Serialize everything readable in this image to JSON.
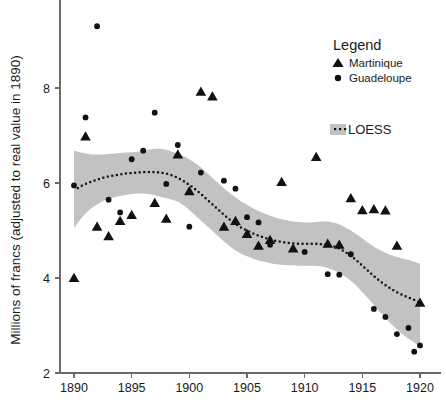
{
  "chart_data": {
    "type": "scatter",
    "title": "",
    "xlabel": "",
    "ylabel": "Millions of francs (adjusted to real value in 1890)",
    "xlim": [
      1889.0,
      1920.8
    ],
    "ylim": [
      2.0,
      9.6
    ],
    "xticks": [
      1890,
      1895,
      1900,
      1905,
      1910,
      1915,
      1920
    ],
    "yticks": [
      2,
      4,
      6,
      8
    ],
    "grid": false,
    "legend_position": "top-right",
    "legend_title": "Legend",
    "series": [
      {
        "name": "Martinique",
        "marker": "triangle",
        "color": "#111111",
        "points": [
          [
            1890,
            4.0
          ],
          [
            1891,
            6.98
          ],
          [
            1892,
            5.08
          ],
          [
            1893,
            4.88
          ],
          [
            1894,
            5.2
          ],
          [
            1895,
            5.33
          ],
          [
            1897,
            5.58
          ],
          [
            1898,
            5.25
          ],
          [
            1899,
            6.6
          ],
          [
            1900,
            5.83
          ],
          [
            1901,
            7.92
          ],
          [
            1902,
            7.82
          ],
          [
            1903,
            5.08
          ],
          [
            1904,
            5.2
          ],
          [
            1905,
            4.93
          ],
          [
            1906,
            4.68
          ],
          [
            1907,
            4.8
          ],
          [
            1908,
            6.02
          ],
          [
            1909,
            4.62
          ],
          [
            1911,
            6.55
          ],
          [
            1912,
            4.72
          ],
          [
            1913,
            4.7
          ],
          [
            1914,
            5.68
          ],
          [
            1915,
            5.43
          ],
          [
            1916,
            5.45
          ],
          [
            1917,
            5.42
          ],
          [
            1918,
            4.68
          ],
          [
            1920,
            3.48
          ]
        ]
      },
      {
        "name": "Guadeloupe",
        "marker": "circle",
        "color": "#111111",
        "points": [
          [
            1890,
            5.95
          ],
          [
            1891,
            7.38
          ],
          [
            1892,
            9.3
          ],
          [
            1893,
            5.65
          ],
          [
            1894,
            5.38
          ],
          [
            1895,
            6.5
          ],
          [
            1896,
            6.68
          ],
          [
            1897,
            7.48
          ],
          [
            1898,
            5.98
          ],
          [
            1899,
            6.8
          ],
          [
            1900,
            5.08
          ],
          [
            1901,
            6.22
          ],
          [
            1903,
            6.05
          ],
          [
            1904,
            5.88
          ],
          [
            1905,
            5.28
          ],
          [
            1906,
            5.17
          ],
          [
            1907,
            4.7
          ],
          [
            1910,
            4.55
          ],
          [
            1912,
            4.08
          ],
          [
            1913,
            4.07
          ],
          [
            1914,
            4.5
          ],
          [
            1916,
            3.35
          ],
          [
            1917,
            3.18
          ],
          [
            1918,
            2.82
          ],
          [
            1919,
            2.95
          ],
          [
            1919.5,
            2.45
          ],
          [
            1920,
            2.58
          ]
        ]
      }
    ],
    "loess": {
      "name": "LOESS",
      "line_style": "dotted",
      "band_color": "#c2c2c2",
      "fit": [
        [
          1890.0,
          5.84
        ],
        [
          1890.5,
          5.92
        ],
        [
          1891.0,
          5.98
        ],
        [
          1891.5,
          6.03
        ],
        [
          1892.0,
          6.07
        ],
        [
          1892.5,
          6.11
        ],
        [
          1893.0,
          6.14
        ],
        [
          1893.5,
          6.16
        ],
        [
          1894.0,
          6.18
        ],
        [
          1894.5,
          6.2
        ],
        [
          1895.0,
          6.21
        ],
        [
          1895.5,
          6.22
        ],
        [
          1896.0,
          6.23
        ],
        [
          1896.5,
          6.23
        ],
        [
          1897.0,
          6.23
        ],
        [
          1897.5,
          6.22
        ],
        [
          1898.0,
          6.2
        ],
        [
          1898.5,
          6.16
        ],
        [
          1899.0,
          6.11
        ],
        [
          1899.5,
          6.04
        ],
        [
          1900.0,
          5.96
        ],
        [
          1900.5,
          5.87
        ],
        [
          1901.0,
          5.77
        ],
        [
          1901.5,
          5.66
        ],
        [
          1902.0,
          5.55
        ],
        [
          1902.5,
          5.44
        ],
        [
          1903.0,
          5.33
        ],
        [
          1903.5,
          5.23
        ],
        [
          1904.0,
          5.14
        ],
        [
          1904.5,
          5.06
        ],
        [
          1905.0,
          5.0
        ],
        [
          1905.5,
          4.94
        ],
        [
          1906.0,
          4.89
        ],
        [
          1906.5,
          4.85
        ],
        [
          1907.0,
          4.81
        ],
        [
          1907.5,
          4.78
        ],
        [
          1908.0,
          4.76
        ],
        [
          1908.5,
          4.74
        ],
        [
          1909.0,
          4.73
        ],
        [
          1909.5,
          4.72
        ],
        [
          1910.0,
          4.72
        ],
        [
          1910.5,
          4.72
        ],
        [
          1911.0,
          4.72
        ],
        [
          1911.5,
          4.71
        ],
        [
          1912.0,
          4.7
        ],
        [
          1912.5,
          4.67
        ],
        [
          1913.0,
          4.62
        ],
        [
          1913.5,
          4.55
        ],
        [
          1914.0,
          4.47
        ],
        [
          1914.5,
          4.37
        ],
        [
          1915.0,
          4.26
        ],
        [
          1915.5,
          4.15
        ],
        [
          1916.0,
          4.04
        ],
        [
          1916.5,
          3.94
        ],
        [
          1917.0,
          3.85
        ],
        [
          1917.5,
          3.77
        ],
        [
          1918.0,
          3.7
        ],
        [
          1918.5,
          3.64
        ],
        [
          1919.0,
          3.59
        ],
        [
          1919.5,
          3.54
        ],
        [
          1920.0,
          3.48
        ]
      ],
      "upper": [
        [
          1890.0,
          6.68
        ],
        [
          1890.5,
          6.65
        ],
        [
          1891.0,
          6.62
        ],
        [
          1891.5,
          6.6
        ],
        [
          1892.0,
          6.6
        ],
        [
          1892.5,
          6.6
        ],
        [
          1893.0,
          6.61
        ],
        [
          1893.5,
          6.62
        ],
        [
          1894.0,
          6.63
        ],
        [
          1894.5,
          6.64
        ],
        [
          1895.0,
          6.65
        ],
        [
          1895.5,
          6.66
        ],
        [
          1896.0,
          6.68
        ],
        [
          1896.5,
          6.7
        ],
        [
          1897.0,
          6.72
        ],
        [
          1897.5,
          6.72
        ],
        [
          1898.0,
          6.7
        ],
        [
          1898.5,
          6.66
        ],
        [
          1899.0,
          6.62
        ],
        [
          1899.5,
          6.57
        ],
        [
          1900.0,
          6.5
        ],
        [
          1900.5,
          6.42
        ],
        [
          1901.0,
          6.33
        ],
        [
          1901.5,
          6.22
        ],
        [
          1902.0,
          6.11
        ],
        [
          1902.5,
          6.0
        ],
        [
          1903.0,
          5.89
        ],
        [
          1903.5,
          5.79
        ],
        [
          1904.0,
          5.7
        ],
        [
          1904.5,
          5.61
        ],
        [
          1905.0,
          5.54
        ],
        [
          1905.5,
          5.47
        ],
        [
          1906.0,
          5.41
        ],
        [
          1906.5,
          5.36
        ],
        [
          1907.0,
          5.31
        ],
        [
          1907.5,
          5.27
        ],
        [
          1908.0,
          5.24
        ],
        [
          1908.5,
          5.21
        ],
        [
          1909.0,
          5.19
        ],
        [
          1909.5,
          5.18
        ],
        [
          1910.0,
          5.17
        ],
        [
          1910.5,
          5.17
        ],
        [
          1911.0,
          5.18
        ],
        [
          1911.5,
          5.19
        ],
        [
          1912.0,
          5.19
        ],
        [
          1912.5,
          5.17
        ],
        [
          1913.0,
          5.13
        ],
        [
          1913.5,
          5.07
        ],
        [
          1914.0,
          5.0
        ],
        [
          1914.5,
          4.92
        ],
        [
          1915.0,
          4.83
        ],
        [
          1915.5,
          4.74
        ],
        [
          1916.0,
          4.66
        ],
        [
          1916.5,
          4.59
        ],
        [
          1917.0,
          4.53
        ],
        [
          1917.5,
          4.48
        ],
        [
          1918.0,
          4.44
        ],
        [
          1918.5,
          4.41
        ],
        [
          1919.0,
          4.38
        ],
        [
          1919.5,
          4.34
        ],
        [
          1920.0,
          4.3
        ]
      ],
      "lower": [
        [
          1890.0,
          5.05
        ],
        [
          1890.5,
          5.22
        ],
        [
          1891.0,
          5.36
        ],
        [
          1891.5,
          5.47
        ],
        [
          1892.0,
          5.55
        ],
        [
          1892.5,
          5.62
        ],
        [
          1893.0,
          5.67
        ],
        [
          1893.5,
          5.7
        ],
        [
          1894.0,
          5.73
        ],
        [
          1894.5,
          5.75
        ],
        [
          1895.0,
          5.77
        ],
        [
          1895.5,
          5.78
        ],
        [
          1896.0,
          5.78
        ],
        [
          1896.5,
          5.77
        ],
        [
          1897.0,
          5.74
        ],
        [
          1897.5,
          5.71
        ],
        [
          1898.0,
          5.68
        ],
        [
          1898.5,
          5.65
        ],
        [
          1899.0,
          5.61
        ],
        [
          1899.5,
          5.53
        ],
        [
          1900.0,
          5.43
        ],
        [
          1900.5,
          5.32
        ],
        [
          1901.0,
          5.21
        ],
        [
          1901.5,
          5.1
        ],
        [
          1902.0,
          4.99
        ],
        [
          1902.5,
          4.88
        ],
        [
          1903.0,
          4.77
        ],
        [
          1903.5,
          4.67
        ],
        [
          1904.0,
          4.58
        ],
        [
          1904.5,
          4.51
        ],
        [
          1905.0,
          4.46
        ],
        [
          1905.5,
          4.41
        ],
        [
          1906.0,
          4.37
        ],
        [
          1906.5,
          4.34
        ],
        [
          1907.0,
          4.31
        ],
        [
          1907.5,
          4.29
        ],
        [
          1908.0,
          4.28
        ],
        [
          1908.5,
          4.27
        ],
        [
          1909.0,
          4.27
        ],
        [
          1909.5,
          4.26
        ],
        [
          1910.0,
          4.26
        ],
        [
          1910.5,
          4.26
        ],
        [
          1911.0,
          4.26
        ],
        [
          1911.5,
          4.24
        ],
        [
          1912.0,
          4.21
        ],
        [
          1912.5,
          4.17
        ],
        [
          1913.0,
          4.11
        ],
        [
          1913.5,
          4.03
        ],
        [
          1914.0,
          3.94
        ],
        [
          1914.5,
          3.83
        ],
        [
          1915.0,
          3.7
        ],
        [
          1915.5,
          3.57
        ],
        [
          1916.0,
          3.43
        ],
        [
          1916.5,
          3.29
        ],
        [
          1917.0,
          3.16
        ],
        [
          1917.5,
          3.03
        ],
        [
          1918.0,
          2.92
        ],
        [
          1918.5,
          2.81
        ],
        [
          1919.0,
          2.72
        ],
        [
          1919.5,
          2.64
        ],
        [
          1920.0,
          2.56
        ]
      ]
    }
  },
  "legend": {
    "title": "Legend",
    "entries": [
      {
        "label": "Martinique",
        "marker": "triangle"
      },
      {
        "label": "Guadeloupe",
        "marker": "circle"
      }
    ],
    "loess_label": "LOESS"
  },
  "axes": {
    "y_title": "Millions of francs (adjusted to real value in 1890)",
    "x_tick_labels": [
      "1890",
      "1895",
      "1900",
      "1905",
      "1910",
      "1915",
      "1920"
    ],
    "y_tick_labels": [
      "2",
      "4",
      "6",
      "8"
    ]
  },
  "colors": {
    "marker": "#111111",
    "band": "#c2c2c2",
    "axis": "#6b6b6b",
    "text": "#1a1a1a",
    "background": "#ffffff"
  }
}
